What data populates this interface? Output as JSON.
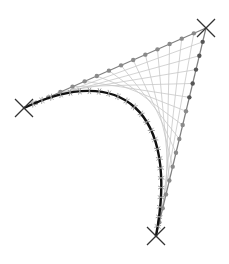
{
  "diagram": {
    "type": "bezier-curve-construction",
    "colors": {
      "background": "#ffffff",
      "curve": "#111111",
      "control_polygon": "#808080",
      "dots_edge_a": "#8a8a8a",
      "dots_edge_b": "#555555",
      "envelope_lines": "#c8c8c8",
      "markers": "#333333",
      "ticks": "#999999"
    },
    "control_points": [
      {
        "name": "P0",
        "x": 24,
        "y": 108
      },
      {
        "name": "P1",
        "x": 206,
        "y": 28
      },
      {
        "name": "P2",
        "x": 156,
        "y": 236
      }
    ],
    "curve_path": {
      "start": [
        24,
        108
      ],
      "c1": [
        120,
        62
      ],
      "c2": [
        180,
        110
      ],
      "end": [
        156,
        236
      ]
    },
    "subdivisions": 15
  }
}
